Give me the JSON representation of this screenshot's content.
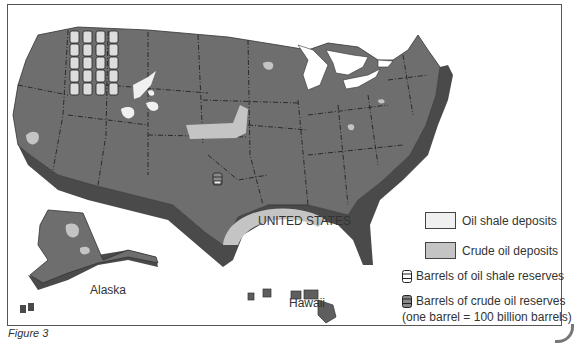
{
  "figure": {
    "caption": "Figure 3",
    "country_label": "UNITED STATES",
    "alaska_label": "Alaska",
    "hawaii_label": "Hawaii"
  },
  "colors": {
    "land": "#6e6e6e",
    "land_side": "#4a4a4a",
    "border_line": "#222222",
    "oil_shale": "#f0f0f0",
    "crude_oil": "#c4c4c4",
    "water": "#ffffff"
  },
  "legend": {
    "items": [
      {
        "type": "swatch",
        "icon": "oil-shale-swatch",
        "label": "Oil shale deposits",
        "color": "#f0f0f0"
      },
      {
        "type": "swatch",
        "icon": "crude-oil-swatch",
        "label": "Crude oil deposits",
        "color": "#c4c4c4"
      },
      {
        "type": "barrel",
        "icon": "oil-shale-barrel-icon",
        "label": "Barrels of oil shale reserves"
      },
      {
        "type": "barrel",
        "icon": "crude-oil-barrel-icon",
        "label": "Barrels of crude oil reserves"
      }
    ],
    "note": "(one barrel = 100 billion barrels)"
  },
  "reserves": {
    "oil_shale_barrel_columns": 4,
    "oil_shale_barrels_per_column": 5,
    "oil_shale_barrels_total": 20,
    "crude_oil_barrels_total": 1,
    "barrel_unit": "100 billion barrels"
  }
}
